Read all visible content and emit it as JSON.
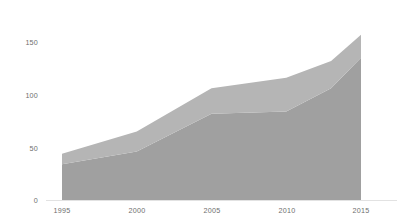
{
  "chart_data": {
    "type": "area",
    "stacked": true,
    "title": "",
    "subtitle": "",
    "xlabel": "",
    "ylabel": "",
    "x": [
      1995,
      2000,
      2005,
      2010,
      2013,
      2015
    ],
    "categories": [
      "1995",
      "2000",
      "2005",
      "2010",
      "2013",
      "2015"
    ],
    "series": [
      {
        "name": "series-1",
        "color": "#a0a0a0",
        "values": [
          34,
          46,
          82,
          84,
          106,
          135
        ]
      },
      {
        "name": "series-2",
        "color": "#b5b5b5",
        "values": [
          10,
          19,
          24,
          32,
          26,
          22
        ]
      }
    ],
    "cumulative_totals": [
      44,
      65,
      106,
      116,
      132,
      157
    ],
    "xlim": [
      1995,
      2015
    ],
    "ylim": [
      0,
      150
    ],
    "x_ticks": [
      1995,
      2000,
      2005,
      2010,
      2015
    ],
    "x_tick_labels": [
      "1995",
      "2000",
      "2005",
      "2010",
      "2015"
    ],
    "y_ticks": [
      0,
      50,
      100,
      150
    ],
    "y_tick_labels": [
      "0",
      "50",
      "100",
      "150"
    ],
    "grid": false,
    "legend": null,
    "legend_position": "none",
    "axis_color": "#e2e2e2",
    "tick_label_color": "#6e6e6e",
    "background": "#ffffff"
  },
  "axes": {
    "y_labels": [
      "150",
      "100",
      "50",
      "0"
    ],
    "x_labels": [
      "1995",
      "2000",
      "2005",
      "2010",
      "2015"
    ]
  }
}
